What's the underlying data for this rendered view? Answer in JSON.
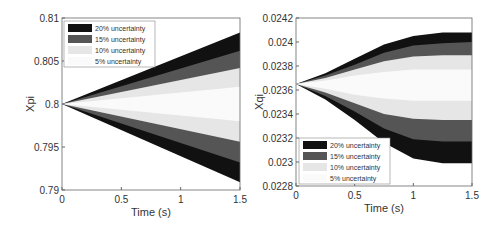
{
  "chart_data": [
    {
      "type": "area",
      "title": "",
      "xlabel": "Time (s)",
      "ylabel": "Xpi",
      "xlim": [
        0,
        1.5
      ],
      "ylim": [
        0.79,
        0.81
      ],
      "xticks": [
        "0",
        "0.5",
        "1",
        "1.5"
      ],
      "yticks": [
        "0.79",
        "0.795",
        "0.8",
        "0.805",
        "0.81"
      ],
      "legend_position": "upper left",
      "x": [
        0,
        1.5
      ],
      "center": 0.8,
      "series": [
        {
          "name": "20% uncertainty",
          "color": "#111111",
          "upper": [
            0.8,
            0.8083
          ],
          "lower": [
            0.8,
            0.7909
          ]
        },
        {
          "name": "15% uncertainty",
          "color": "#555555",
          "upper": [
            0.8,
            0.8062
          ],
          "lower": [
            0.8,
            0.7932
          ]
        },
        {
          "name": "10% uncertainty",
          "color": "#e6e6e6",
          "upper": [
            0.8,
            0.8042
          ],
          "lower": [
            0.8,
            0.7956
          ]
        },
        {
          "name": "5% uncertainty",
          "color": "#fafafa",
          "upper": [
            0.8,
            0.802
          ],
          "lower": [
            0.8,
            0.798
          ]
        }
      ]
    },
    {
      "type": "area",
      "title": "",
      "xlabel": "Time (s)",
      "ylabel": "Xqi",
      "xlim": [
        0,
        1.5
      ],
      "ylim": [
        0.0228,
        0.0242
      ],
      "xticks": [
        "0",
        "0.5",
        "1",
        "1.5"
      ],
      "yticks": [
        "0.0228",
        "0.023",
        "0.0232",
        "0.0234",
        "0.0236",
        "0.0238",
        "0.024",
        "0.0242"
      ],
      "legend_position": "lower left",
      "x": [
        0,
        0.25,
        0.5,
        0.75,
        1.0,
        1.25,
        1.5
      ],
      "center": 0.02365,
      "series": [
        {
          "name": "20% uncertainty",
          "color": "#111111",
          "upper": [
            0.02365,
            0.02374,
            0.02386,
            0.02398,
            0.02405,
            0.02408,
            0.02408
          ],
          "lower": [
            0.02365,
            0.02352,
            0.02335,
            0.02316,
            0.02303,
            0.02299,
            0.02299
          ]
        },
        {
          "name": "15% uncertainty",
          "color": "#555555",
          "upper": [
            0.02365,
            0.02372,
            0.02381,
            0.02391,
            0.02397,
            0.02399,
            0.024
          ],
          "lower": [
            0.02365,
            0.02355,
            0.02342,
            0.02328,
            0.02319,
            0.02317,
            0.02317
          ]
        },
        {
          "name": "10% uncertainty",
          "color": "#e6e6e6",
          "upper": [
            0.02365,
            0.0237,
            0.02377,
            0.02384,
            0.02388,
            0.02389,
            0.02389
          ],
          "lower": [
            0.02365,
            0.02358,
            0.02349,
            0.0234,
            0.02336,
            0.02335,
            0.02335
          ]
        },
        {
          "name": "5% uncertainty",
          "color": "#fafafa",
          "upper": [
            0.02365,
            0.02368,
            0.02372,
            0.02375,
            0.02377,
            0.02377,
            0.02377
          ],
          "lower": [
            0.02365,
            0.02361,
            0.02356,
            0.02353,
            0.02351,
            0.02351,
            0.02351
          ]
        }
      ]
    }
  ]
}
